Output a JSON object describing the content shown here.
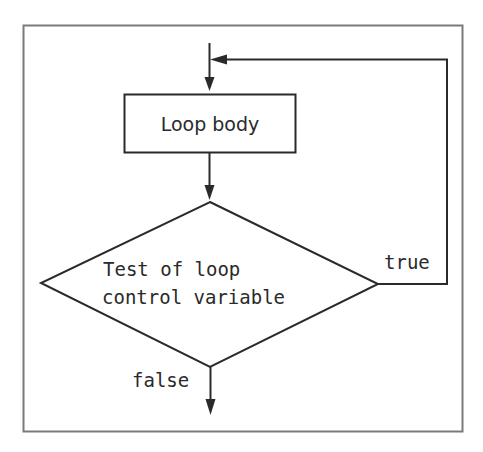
{
  "diagram": {
    "type": "flowchart",
    "title": "",
    "nodes": {
      "loop_body": {
        "shape": "rectangle",
        "label": "Loop body"
      },
      "test": {
        "shape": "diamond",
        "label_line1": "Test of loop",
        "label_line2": "control variable"
      }
    },
    "edges": {
      "true_label": "true",
      "false_label": "false"
    },
    "colors": {
      "stroke": "#2a2a2a",
      "frame": "#7a7a7a",
      "background": "#ffffff"
    }
  }
}
